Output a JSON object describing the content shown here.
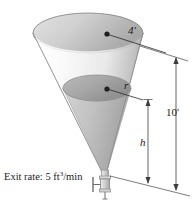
{
  "figure": {
    "background_color": "#ffffff"
  },
  "labels": {
    "exit_rate_prefix": "Exit rate: 5 ft",
    "exit_rate_exponent": "3",
    "exit_rate_suffix": "/min",
    "top_radius": "4'",
    "inner_radius": "r",
    "total_height": "10'",
    "liquid_height": "h"
  },
  "colors": {
    "ink": "#1b1b1b",
    "outline": "#8d8d8d",
    "rim_fill_light": "#d6d6d6",
    "rim_fill_dark": "#b0b0b0",
    "cone_wall_light": "#f2f2f2",
    "cone_wall_mid": "#d9d9d9",
    "cone_wall_dark": "#a9a9a9",
    "liquid_fill": "#b4b4b4",
    "liquid_surface": "#9e9e9e",
    "valve_body": "#d2d2d2",
    "dimension_line": "#5a5a5a"
  },
  "geometry": {
    "cone_apex": {
      "x": 105,
      "y": 178
    },
    "cone_rim_center": {
      "x": 88,
      "y": 33
    },
    "cone_rim_radius_x": 55,
    "cone_rim_radius_y": 20,
    "liquid_surface_center": {
      "x": 97,
      "y": 88
    },
    "liquid_surface_radius_x": 34,
    "liquid_surface_radius_y": 13,
    "top_radius_dot": {
      "x": 107,
      "y": 34
    },
    "inner_radius_dot": {
      "x": 107,
      "y": 89
    },
    "dimension_total_x": 176,
    "dimension_liquid_x": 148
  },
  "parts": [
    {
      "name": "cone-tank",
      "interactable": false
    },
    {
      "name": "liquid-body",
      "interactable": false
    },
    {
      "name": "drain-valve",
      "interactable": false
    },
    {
      "name": "dimension-total-height",
      "interactable": false
    },
    {
      "name": "dimension-liquid-height",
      "interactable": false
    },
    {
      "name": "radius-leader-top",
      "interactable": false
    },
    {
      "name": "radius-leader-inner",
      "interactable": false
    }
  ]
}
